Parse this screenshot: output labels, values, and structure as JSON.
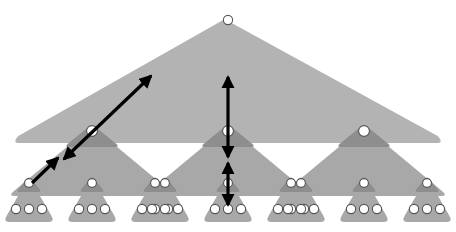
{
  "figure": {
    "name": "hierarchical-triangle-tree",
    "width": 456,
    "height": 232,
    "background": "#ffffff"
  },
  "colors": {
    "triangle_light": "#b3b3b3",
    "triangle_mid": "#a8a8a8",
    "triangle_dark": "#8e8e8e",
    "node_fill": "#ffffff",
    "node_stroke": "#555555",
    "arrow": "#000000"
  },
  "levels": [
    {
      "level": 0,
      "label": "root",
      "node_count": 1,
      "triangle_count": 1
    },
    {
      "level": 1,
      "label": "internal",
      "node_count": 3,
      "triangle_count": 3
    },
    {
      "level": 2,
      "label": "leaf-cluster",
      "node_count": 9,
      "triangle_count": 9
    },
    {
      "level": 3,
      "label": "leaf",
      "node_count": 27,
      "triangle_count": 0
    }
  ],
  "root_triangle": {
    "apex_x": 228,
    "apex_y": 14,
    "left_x": 12,
    "right_x": 444,
    "base_y": 143,
    "fill": "#b3b3b3"
  },
  "root_node": {
    "cx": 228,
    "cy": 20,
    "r": 4.6
  },
  "mid_triangles": [
    {
      "apex_x": 92,
      "apex_y": 126,
      "half_width": 84,
      "base_y": 196,
      "fill": "#a8a8a8"
    },
    {
      "apex_x": 228,
      "apex_y": 126,
      "half_width": 84,
      "base_y": 196,
      "fill": "#a8a8a8"
    },
    {
      "apex_x": 364,
      "apex_y": 126,
      "half_width": 84,
      "base_y": 196,
      "fill": "#a8a8a8"
    }
  ],
  "mid_caps": [
    {
      "apex_x": 92,
      "apex_y": 124,
      "half_width": 28,
      "base_y": 147,
      "fill": "#8e8e8e"
    },
    {
      "apex_x": 228,
      "apex_y": 124,
      "half_width": 28,
      "base_y": 147,
      "fill": "#8e8e8e"
    },
    {
      "apex_x": 364,
      "apex_y": 124,
      "half_width": 28,
      "base_y": 147,
      "fill": "#8e8e8e"
    }
  ],
  "mid_nodes": [
    {
      "cx": 92,
      "cy": 131,
      "r": 5.4
    },
    {
      "cx": 228,
      "cy": 131,
      "r": 5.4
    },
    {
      "cx": 364,
      "cy": 131,
      "r": 5.4
    }
  ],
  "leaf_triangles": [
    {
      "id": "leaf-0",
      "cx": 29,
      "apex_y": 177,
      "half_width": 26,
      "base_y": 222,
      "fill": "#a8a8a8"
    },
    {
      "id": "leaf-1",
      "cx": 92,
      "apex_y": 177,
      "half_width": 26,
      "base_y": 222,
      "fill": "#a8a8a8"
    },
    {
      "id": "leaf-2",
      "cx": 155,
      "apex_y": 177,
      "half_width": 26,
      "base_y": 222,
      "fill": "#a8a8a8"
    },
    {
      "id": "leaf-3",
      "cx": 165,
      "apex_y": 177,
      "half_width": 26,
      "base_y": 222,
      "fill": "#a8a8a8"
    },
    {
      "id": "leaf-4",
      "cx": 228,
      "apex_y": 177,
      "half_width": 26,
      "base_y": 222,
      "fill": "#a8a8a8"
    },
    {
      "id": "leaf-5",
      "cx": 291,
      "apex_y": 177,
      "half_width": 26,
      "base_y": 222,
      "fill": "#a8a8a8"
    },
    {
      "id": "leaf-6",
      "cx": 301,
      "apex_y": 177,
      "half_width": 26,
      "base_y": 222,
      "fill": "#a8a8a8"
    },
    {
      "id": "leaf-7",
      "cx": 364,
      "apex_y": 177,
      "half_width": 26,
      "base_y": 222,
      "fill": "#a8a8a8"
    },
    {
      "id": "leaf-8",
      "cx": 427,
      "apex_y": 177,
      "half_width": 26,
      "base_y": 222,
      "fill": "#a8a8a8"
    }
  ],
  "leaf_caps": [
    {
      "cx": 29,
      "apex_y": 176,
      "half_width": 13,
      "base_y": 192,
      "fill": "#8e8e8e"
    },
    {
      "cx": 92,
      "apex_y": 176,
      "half_width": 13,
      "base_y": 192,
      "fill": "#8e8e8e"
    },
    {
      "cx": 155,
      "apex_y": 176,
      "half_width": 13,
      "base_y": 192,
      "fill": "#8e8e8e"
    },
    {
      "cx": 165,
      "apex_y": 176,
      "half_width": 13,
      "base_y": 192,
      "fill": "#8e8e8e"
    },
    {
      "cx": 228,
      "apex_y": 176,
      "half_width": 13,
      "base_y": 192,
      "fill": "#8e8e8e"
    },
    {
      "cx": 291,
      "apex_y": 176,
      "half_width": 13,
      "base_y": 192,
      "fill": "#8e8e8e"
    },
    {
      "cx": 301,
      "apex_y": 176,
      "half_width": 13,
      "base_y": 192,
      "fill": "#8e8e8e"
    },
    {
      "cx": 364,
      "apex_y": 176,
      "half_width": 13,
      "base_y": 192,
      "fill": "#8e8e8e"
    },
    {
      "cx": 427,
      "apex_y": 176,
      "half_width": 13,
      "base_y": 192,
      "fill": "#8e8e8e"
    }
  ],
  "leaf_nodes": [
    {
      "cx": 29,
      "cy": 183,
      "r": 4.4
    },
    {
      "cx": 92,
      "cy": 183,
      "r": 4.4
    },
    {
      "cx": 155,
      "cy": 183,
      "r": 4.4
    },
    {
      "cx": 165,
      "cy": 183,
      "r": 4.4
    },
    {
      "cx": 228,
      "cy": 183,
      "r": 4.4
    },
    {
      "cx": 291,
      "cy": 183,
      "r": 4.4
    },
    {
      "cx": 301,
      "cy": 183,
      "r": 4.4
    },
    {
      "cx": 364,
      "cy": 183,
      "r": 4.4
    },
    {
      "cx": 427,
      "cy": 183,
      "r": 4.4
    }
  ],
  "bottom_nodes": [
    {
      "cx": 16,
      "cy": 209,
      "r": 4.6
    },
    {
      "cx": 29,
      "cy": 209,
      "r": 4.6
    },
    {
      "cx": 42,
      "cy": 209,
      "r": 4.6
    },
    {
      "cx": 79,
      "cy": 209,
      "r": 4.6
    },
    {
      "cx": 92,
      "cy": 209,
      "r": 4.6
    },
    {
      "cx": 105,
      "cy": 209,
      "r": 4.6
    },
    {
      "cx": 142,
      "cy": 209,
      "r": 4.6
    },
    {
      "cx": 155,
      "cy": 209,
      "r": 4.6
    },
    {
      "cx": 168,
      "cy": 209,
      "r": 4.6
    },
    {
      "cx": 152,
      "cy": 209,
      "r": 4.6
    },
    {
      "cx": 165,
      "cy": 209,
      "r": 4.6
    },
    {
      "cx": 178,
      "cy": 209,
      "r": 4.6
    },
    {
      "cx": 215,
      "cy": 209,
      "r": 4.6
    },
    {
      "cx": 228,
      "cy": 209,
      "r": 4.6
    },
    {
      "cx": 241,
      "cy": 209,
      "r": 4.6
    },
    {
      "cx": 278,
      "cy": 209,
      "r": 4.6
    },
    {
      "cx": 291,
      "cy": 209,
      "r": 4.6
    },
    {
      "cx": 304,
      "cy": 209,
      "r": 4.6
    },
    {
      "cx": 288,
      "cy": 209,
      "r": 4.6
    },
    {
      "cx": 301,
      "cy": 209,
      "r": 4.6
    },
    {
      "cx": 314,
      "cy": 209,
      "r": 4.6
    },
    {
      "cx": 351,
      "cy": 209,
      "r": 4.6
    },
    {
      "cx": 364,
      "cy": 209,
      "r": 4.6
    },
    {
      "cx": 377,
      "cy": 209,
      "r": 4.6
    },
    {
      "cx": 414,
      "cy": 209,
      "r": 4.6
    },
    {
      "cx": 427,
      "cy": 209,
      "r": 4.6
    },
    {
      "cx": 440,
      "cy": 209,
      "r": 4.6
    }
  ],
  "arrows": [
    {
      "id": "arrow-diagonal-long",
      "name": "long-diagonal-double-arrow",
      "x1": 151,
      "y1": 76,
      "x2": 64,
      "y2": 159,
      "heads": "both",
      "stroke_width": 3.2
    },
    {
      "id": "arrow-diagonal-short",
      "name": "short-diagonal-double-arrow",
      "x1": 58,
      "y1": 158,
      "x2": 32,
      "y2": 183,
      "heads": "start",
      "stroke_width": 3.2
    },
    {
      "id": "arrow-vertical-upper",
      "name": "upper-vertical-double-arrow",
      "x1": 228,
      "y1": 77,
      "x2": 228,
      "y2": 157,
      "heads": "both",
      "stroke_width": 3.2
    },
    {
      "id": "arrow-vertical-lower",
      "name": "lower-vertical-double-arrow",
      "x1": 228,
      "y1": 163,
      "x2": 228,
      "y2": 205,
      "heads": "both",
      "stroke_width": 3.2
    }
  ]
}
